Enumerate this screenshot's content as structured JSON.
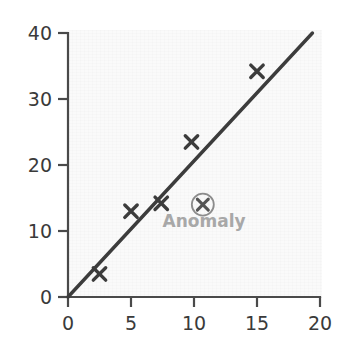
{
  "chart_data": {
    "type": "scatter",
    "title": "",
    "subtitle": "",
    "xlabel": "",
    "ylabel": "",
    "xlim": [
      0,
      20
    ],
    "ylim": [
      0,
      40
    ],
    "xticks": [
      0,
      5,
      10,
      15,
      20
    ],
    "yticks": [
      0,
      10,
      20,
      30,
      40
    ],
    "xtick_labels": [
      "0",
      "5",
      "10",
      "15",
      "20"
    ],
    "ytick_labels": [
      "0",
      "10",
      "20",
      "30",
      "40"
    ],
    "grid": false,
    "legend": null,
    "legend_position": "none",
    "series": [
      {
        "name": "data-points",
        "marker": "x",
        "color": "#3c3c3c",
        "points": [
          {
            "x": 2.5,
            "y": 3.5
          },
          {
            "x": 5.0,
            "y": 13.0
          },
          {
            "x": 7.4,
            "y": 14.2
          },
          {
            "x": 9.8,
            "y": 23.5
          },
          {
            "x": 15.0,
            "y": 34.2
          }
        ]
      },
      {
        "name": "anomaly-point",
        "marker": "circled-x",
        "color": "#8c8c8c",
        "points": [
          {
            "x": 10.7,
            "y": 14.0
          }
        ]
      }
    ],
    "trendline": {
      "name": "fit-line",
      "color": "#3c3c3c",
      "from": {
        "x": 0,
        "y": 0
      },
      "to": {
        "x": 19.4,
        "y": 40
      }
    },
    "annotations": [
      {
        "name": "anomaly",
        "text": "Anomaly",
        "color": "#a8a8a8",
        "x": 10.8,
        "y": 10.6
      }
    ]
  },
  "axes": {
    "x_axis_name": "x-axis",
    "y_axis_name": "y-axis"
  }
}
